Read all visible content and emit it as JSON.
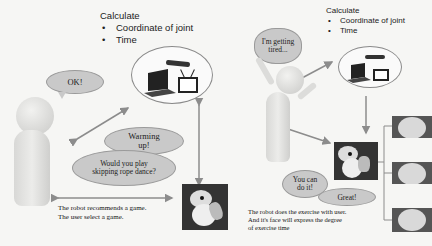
{
  "left_panel": {
    "calc_title": "Calculate",
    "calc_items": [
      "Coordinate of joint",
      "Time"
    ],
    "user_speech": "OK!",
    "robot_speech_1": "Warming up!",
    "robot_speech_2": "Would you play skipping rope dance?",
    "caption_lines": [
      "The robot recommends a game.",
      "The user select a game."
    ]
  },
  "right_panel": {
    "calc_title": "Calculate",
    "calc_items": [
      "Coordinate of joint",
      "Time"
    ],
    "user_speech": "I'm getting tired...",
    "robot_speech_1": "You can do it!",
    "robot_speech_2": "Great!",
    "caption_lines": [
      "The robot does the exercise with user.",
      "And it's face will express the degree",
      "of exercise time"
    ]
  },
  "colors": {
    "background": "#f6f6f4",
    "bubble_fill": "#c9c9c9",
    "arrow": "#8c8c8c",
    "ellipse_border": "#8a8a8a"
  }
}
